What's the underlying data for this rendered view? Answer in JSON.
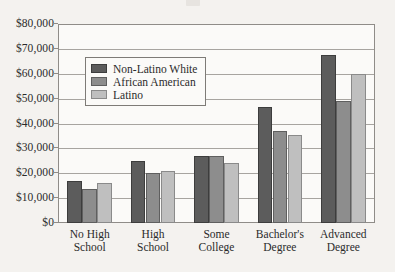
{
  "chart_data": {
    "type": "bar",
    "title": "",
    "subtitle": "",
    "xlabel": "",
    "ylabel": "",
    "grid": true,
    "legend_position": "upper-left-inside",
    "ylim": [
      0,
      80000
    ],
    "ytick_values": [
      0,
      10000,
      20000,
      30000,
      40000,
      50000,
      60000,
      70000,
      80000
    ],
    "ytick_labels": [
      "$0",
      "$10,000",
      "$20,000",
      "$30,000",
      "$40,000",
      "$50,000",
      "$60,000",
      "$70,000",
      "$80,000"
    ],
    "categories": [
      "No High School",
      "High School",
      "Some College",
      "Bachelor's Degree",
      "Advanced Degree"
    ],
    "category_lines": [
      [
        "No High",
        "School"
      ],
      [
        "High",
        "School"
      ],
      [
        "Some",
        "College"
      ],
      [
        "Bachelor's",
        "Degree"
      ],
      [
        "Advanced",
        "Degree"
      ]
    ],
    "series": [
      {
        "name": "Non-Latino White",
        "color": "#5c5c5c",
        "values": [
          17000,
          25000,
          26800,
          46500,
          67500
        ]
      },
      {
        "name": "African American",
        "color": "#8d8d8d",
        "values": [
          13800,
          20000,
          26800,
          36800,
          49000
        ]
      },
      {
        "name": "Latino",
        "color": "#bfbfbf",
        "values": [
          16200,
          20800,
          24000,
          35200,
          59800
        ]
      }
    ]
  }
}
